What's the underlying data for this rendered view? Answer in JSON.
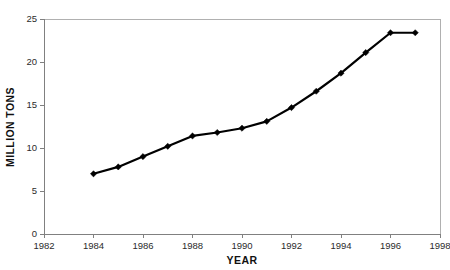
{
  "top_sliver_text": "",
  "chart_data": {
    "type": "line",
    "title": "",
    "xlabel": "YEAR",
    "ylabel": "MILLION TONS",
    "xlim": [
      1982,
      1998
    ],
    "ylim": [
      0,
      25
    ],
    "xticks": [
      1982,
      1984,
      1986,
      1988,
      1990,
      1992,
      1994,
      1996,
      1998
    ],
    "xtick_labels": [
      "1982",
      "1984",
      "1986",
      "1988",
      "1990",
      "1992",
      "1994",
      "1996",
      "1998"
    ],
    "yticks": [
      0,
      5,
      10,
      15,
      20,
      25
    ],
    "ytick_labels": [
      "0",
      "5",
      "10",
      "15",
      "20",
      "25"
    ],
    "grid": false,
    "legend": null,
    "marker": "diamond",
    "line_color": "#000000",
    "marker_color": "#000000",
    "x": [
      1984,
      1985,
      1986,
      1987,
      1988,
      1989,
      1990,
      1991,
      1992,
      1993,
      1994,
      1995,
      1996,
      1997
    ],
    "values": [
      7.0,
      7.8,
      9.0,
      10.2,
      11.4,
      11.8,
      12.3,
      13.1,
      14.7,
      16.6,
      18.7,
      21.1,
      23.4,
      23.4
    ],
    "series": [
      {
        "name": "Million tons",
        "x": [
          1984,
          1985,
          1986,
          1987,
          1988,
          1989,
          1990,
          1991,
          1992,
          1993,
          1994,
          1995,
          1996,
          1997
        ],
        "values": [
          7.0,
          7.8,
          9.0,
          10.2,
          11.4,
          11.8,
          12.3,
          13.1,
          14.7,
          16.6,
          18.7,
          21.1,
          23.4,
          23.4
        ]
      }
    ]
  }
}
